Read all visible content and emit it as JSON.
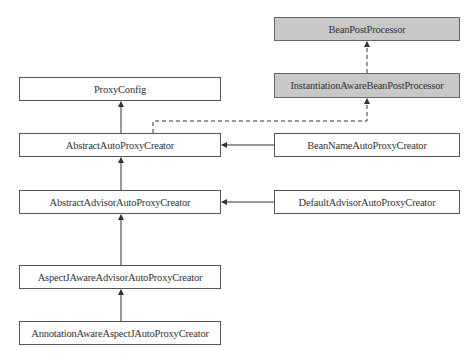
{
  "diagram": {
    "type": "class-hierarchy",
    "colors": {
      "interface_fill": "#c8c8c8",
      "class_fill": "#ffffff",
      "line": "#444444"
    },
    "nodes": [
      {
        "id": "bpp",
        "label": "BeanPostProcessor",
        "kind": "interface"
      },
      {
        "id": "iabpp",
        "label": "InstantiationAwareBeanPostProcessor",
        "kind": "interface"
      },
      {
        "id": "pc",
        "label": "ProxyConfig",
        "kind": "class"
      },
      {
        "id": "aapc",
        "label": "AbstractAutoProxyCreator",
        "kind": "class"
      },
      {
        "id": "bnapc",
        "label": "BeanNameAutoProxyCreator",
        "kind": "class"
      },
      {
        "id": "aaapc",
        "label": "AbstractAdvisorAutoProxyCreator",
        "kind": "class"
      },
      {
        "id": "daapc",
        "label": "DefaultAdvisorAutoProxyCreator",
        "kind": "class"
      },
      {
        "id": "ajaapc",
        "label": "AspectJAwareAdvisorAutoProxyCreator",
        "kind": "class"
      },
      {
        "id": "aaajpc",
        "label": "AnnotationAwareAspectJAutoProxyCreator",
        "kind": "class"
      }
    ],
    "edges": [
      {
        "from": "iabpp",
        "to": "bpp",
        "style": "dashed",
        "relation": "extends-interface"
      },
      {
        "from": "aapc",
        "to": "iabpp",
        "style": "dashed",
        "relation": "implements"
      },
      {
        "from": "aapc",
        "to": "pc",
        "style": "solid",
        "relation": "extends"
      },
      {
        "from": "bnapc",
        "to": "aapc",
        "style": "solid",
        "relation": "extends"
      },
      {
        "from": "aaapc",
        "to": "aapc",
        "style": "solid",
        "relation": "extends"
      },
      {
        "from": "daapc",
        "to": "aaapc",
        "style": "solid",
        "relation": "extends"
      },
      {
        "from": "ajaapc",
        "to": "aaapc",
        "style": "solid",
        "relation": "extends"
      },
      {
        "from": "aaajpc",
        "to": "ajaapc",
        "style": "solid",
        "relation": "extends"
      }
    ]
  }
}
